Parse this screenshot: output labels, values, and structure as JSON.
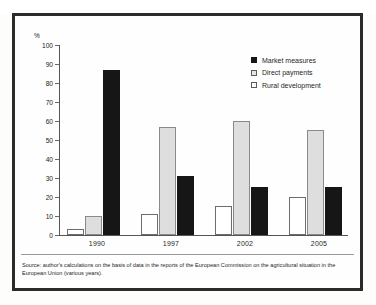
{
  "chart_data": {
    "type": "bar",
    "title": "",
    "subtitle": "",
    "xlabel": "",
    "ylabel": "%",
    "ylim": [
      0,
      100
    ],
    "ytick_step": 10,
    "grid": false,
    "legend_position": "top-right",
    "orientation": "vertical",
    "grouping": "grouped",
    "categories": [
      "1990",
      "1997",
      "2002",
      "2005"
    ],
    "yticks": [
      "100",
      "90",
      "80",
      "70",
      "60",
      "50",
      "40",
      "30",
      "20",
      "10",
      "0"
    ],
    "series": [
      {
        "name": "Rural development",
        "key": "rural",
        "color": "#ffffff",
        "border_color": "#6d6d6d",
        "values": [
          3,
          11,
          15,
          20
        ]
      },
      {
        "name": "Direct payments",
        "key": "direct",
        "color": "#dedede",
        "border_color": "#8a8a8a",
        "values": [
          10,
          57,
          60,
          55
        ]
      },
      {
        "name": "Market measures",
        "key": "market",
        "color": "#161616",
        "border_color": "#161616",
        "values": [
          87,
          31,
          25,
          25
        ]
      }
    ],
    "legend_order": [
      "Market measures",
      "Direct payments",
      "Rural development"
    ],
    "bar_draw_order": [
      "Rural development",
      "Direct payments",
      "Market measures"
    ],
    "annotations": []
  },
  "legend": {
    "items": [
      {
        "label": "Market measures",
        "swatch": "market-swatch-icon"
      },
      {
        "label": "Direct payments",
        "swatch": "direct-swatch-icon"
      },
      {
        "label": "Rural development",
        "swatch": "rural-swatch-icon"
      }
    ]
  },
  "axis": {
    "y_unit": "%",
    "y_ticks": [
      "100",
      "90",
      "80",
      "70",
      "60",
      "50",
      "40",
      "30",
      "20",
      "10",
      "0"
    ],
    "x_ticks": [
      "1990",
      "1997",
      "2002",
      "2005"
    ]
  },
  "footer": {
    "source_note": "Source: author's calculations on the basis of data in the reports of the European Commission on the agricultural situation in the European Union (various years)."
  }
}
